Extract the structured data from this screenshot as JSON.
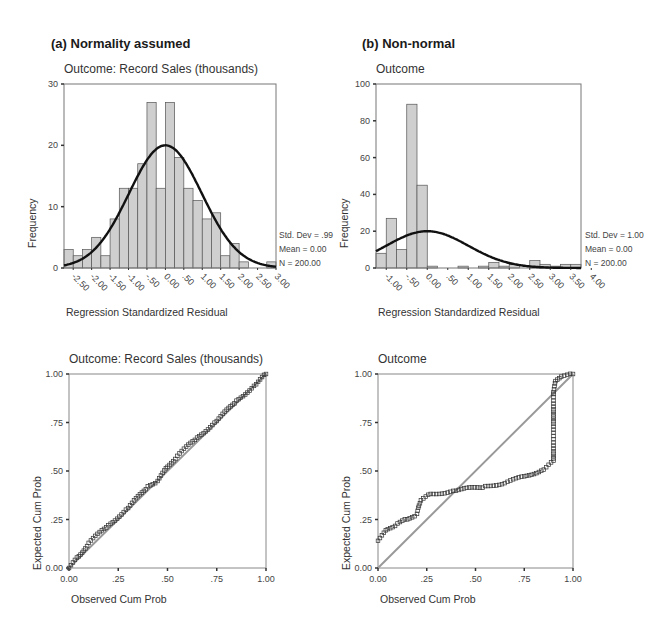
{
  "panels": {
    "a": {
      "label": "(a) Normality assumed"
    },
    "b": {
      "label": "(b) Non-normal"
    }
  },
  "chart_data": [
    {
      "id": "hist_a",
      "type": "bar",
      "title": "Outcome: Record Sales (thousands)",
      "xlabel": "Regression Standardized Residual",
      "ylabel": "Frequency",
      "ylim": [
        0,
        30
      ],
      "yticks": [
        "0",
        "10",
        "20",
        "30"
      ],
      "xticks": [
        "-2.50",
        "-2.00",
        "-1.50",
        "-1.00",
        "-.50",
        "0.00",
        ".50",
        "1.00",
        "1.50",
        "2.00",
        "2.50",
        "3.00"
      ],
      "bin_start": -2.75,
      "bin_width": 0.25,
      "values": [
        3,
        2,
        3,
        5,
        2,
        8,
        13,
        13,
        17,
        27,
        13,
        27,
        18,
        13,
        11,
        8,
        9,
        2,
        4,
        1,
        0,
        0,
        1
      ],
      "normal_curve": {
        "mean": 0.0,
        "sd": 0.99,
        "peak": 20
      },
      "stats": {
        "std_dev": "Std. Dev = .99",
        "mean": "Mean = 0.00",
        "n": "N = 200.00"
      }
    },
    {
      "id": "hist_b",
      "type": "bar",
      "title": "Outcome",
      "xlabel": "Regression Standardized Residual",
      "ylabel": "Frequency",
      "ylim": [
        0,
        100
      ],
      "yticks": [
        "0",
        "20",
        "40",
        "60",
        "80",
        "100"
      ],
      "xticks": [
        "-1.00",
        "-.50",
        "0.00",
        ".50",
        "1.00",
        "1.50",
        "2.00",
        "2.50",
        "3.00",
        "3.50",
        "4.00"
      ],
      "bin_start": -1.25,
      "bin_width": 0.25,
      "values": [
        8,
        27,
        10,
        89,
        45,
        1,
        0,
        0,
        1,
        0,
        1,
        3,
        1,
        2,
        0,
        4,
        2,
        1,
        2,
        2
      ],
      "normal_curve": {
        "mean": 0.0,
        "sd": 1.0,
        "peak": 20
      },
      "stats": {
        "std_dev": "Std. Dev = 1.00",
        "mean": "Mean = 0.00",
        "n": "N = 200.00"
      }
    },
    {
      "id": "pp_a",
      "type": "scatter",
      "title": "Outcome: Record Sales (thousands)",
      "xlabel": "Observed Cum Prob",
      "ylabel": "Expected Cum Prob",
      "xlim": [
        0,
        1
      ],
      "ylim": [
        0,
        1
      ],
      "xticks": [
        "0.00",
        ".25",
        ".50",
        ".75",
        "1.00"
      ],
      "yticks": [
        "0.00",
        ".25",
        ".50",
        ".75",
        "1.00"
      ],
      "reference_line": [
        [
          0,
          0
        ],
        [
          1,
          1
        ]
      ],
      "points_profile": [
        [
          0,
          0
        ],
        [
          0.05,
          0.06
        ],
        [
          0.1,
          0.13
        ],
        [
          0.2,
          0.22
        ],
        [
          0.3,
          0.31
        ],
        [
          0.4,
          0.42
        ],
        [
          0.45,
          0.45
        ],
        [
          0.5,
          0.52
        ],
        [
          0.55,
          0.58
        ],
        [
          0.65,
          0.67
        ],
        [
          0.75,
          0.76
        ],
        [
          0.85,
          0.86
        ],
        [
          0.95,
          0.95
        ],
        [
          1,
          1
        ]
      ]
    },
    {
      "id": "pp_b",
      "type": "scatter",
      "title": "Outcome",
      "xlabel": "Observed Cum Prob",
      "ylabel": "Expected Cum Prob",
      "xlim": [
        0,
        1
      ],
      "ylim": [
        0,
        1
      ],
      "xticks": [
        "0.00",
        ".25",
        ".50",
        ".75",
        "1.00"
      ],
      "yticks": [
        "0.00",
        ".25",
        ".50",
        ".75",
        "1.00"
      ],
      "reference_line": [
        [
          0,
          0
        ],
        [
          1,
          1
        ]
      ],
      "points_profile": [
        [
          0,
          0.14
        ],
        [
          0.05,
          0.2
        ],
        [
          0.1,
          0.23
        ],
        [
          0.15,
          0.25
        ],
        [
          0.2,
          0.28
        ],
        [
          0.21,
          0.32
        ],
        [
          0.22,
          0.35
        ],
        [
          0.27,
          0.38
        ],
        [
          0.4,
          0.4
        ],
        [
          0.55,
          0.42
        ],
        [
          0.65,
          0.44
        ],
        [
          0.75,
          0.47
        ],
        [
          0.85,
          0.51
        ],
        [
          0.9,
          0.55
        ],
        [
          0.9,
          0.91
        ],
        [
          0.91,
          0.96
        ],
        [
          0.94,
          0.99
        ],
        [
          1,
          1
        ]
      ]
    }
  ]
}
